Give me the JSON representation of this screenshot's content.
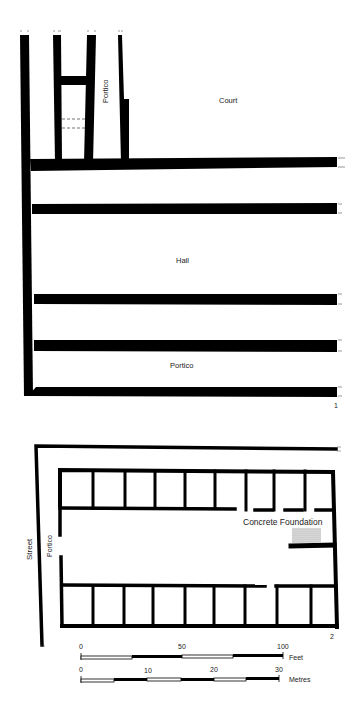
{
  "plan1": {
    "figure_number": "1",
    "labels": {
      "portico_top": "Portico",
      "court": "Court",
      "hall": "Hall",
      "portico_bottom": "Portico"
    }
  },
  "plan2": {
    "figure_number": "2",
    "labels": {
      "street": "Street",
      "portico": "Portico",
      "concrete_foundation": "Concrete Foundation"
    }
  },
  "scale_bars": {
    "feet": {
      "unit": "Feet",
      "ticks": [
        "0",
        "50",
        "100"
      ]
    },
    "metres": {
      "unit": "Metres",
      "ticks": [
        "0",
        "10",
        "20",
        "30"
      ]
    }
  },
  "colors": {
    "wall": "#000000",
    "background": "#ffffff",
    "foundation_fill": "#bdbdbd"
  }
}
